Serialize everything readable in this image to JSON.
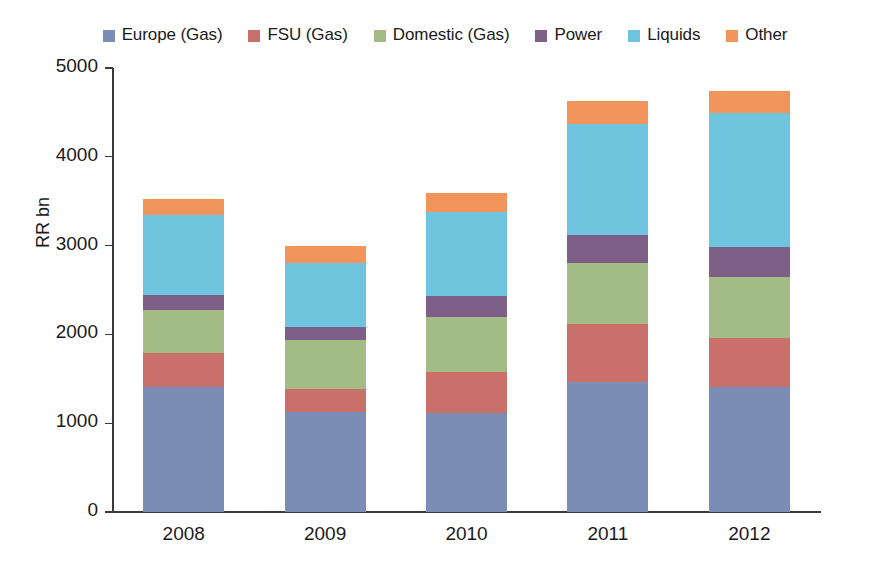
{
  "chart_data": {
    "type": "bar",
    "stacked": true,
    "title": "",
    "subtitle": "",
    "xlabel": "",
    "ylabel": "RR bn",
    "categories": [
      "2008",
      "2009",
      "2010",
      "2011",
      "2012"
    ],
    "ylim": [
      0,
      5000
    ],
    "yticks": [
      0,
      1000,
      2000,
      3000,
      4000,
      5000
    ],
    "ytick_labels": [
      "0",
      "1000",
      "2000",
      "3000",
      "4000",
      "5000"
    ],
    "grid": false,
    "legend_position": "top",
    "series": [
      {
        "name": "Europe (Gas)",
        "color": "#7b8cb5",
        "values": [
          1410,
          1125,
          1115,
          1465,
          1405
        ]
      },
      {
        "name": "FSU (Gas)",
        "color": "#c9706a",
        "values": [
          380,
          260,
          460,
          650,
          560
        ]
      },
      {
        "name": "Domestic (Gas)",
        "color": "#a3bc85",
        "values": [
          490,
          550,
          620,
          685,
          680
        ]
      },
      {
        "name": "Power",
        "color": "#7e5f87",
        "values": [
          160,
          145,
          235,
          325,
          345
        ]
      },
      {
        "name": "Liquids",
        "color": "#6ec3dd",
        "values": [
          900,
          730,
          945,
          1240,
          1500
        ]
      },
      {
        "name": "Other",
        "color": "#f2955c",
        "values": [
          180,
          190,
          215,
          260,
          250
        ]
      }
    ],
    "totals": [
      3520,
      3000,
      3590,
      4625,
      4740
    ]
  }
}
